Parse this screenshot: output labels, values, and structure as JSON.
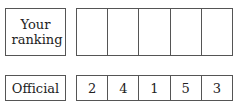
{
  "rows": [
    {
      "label": "Your ranking",
      "cells": [
        "",
        "",
        "",
        "",
        ""
      ]
    },
    {
      "label": "Official",
      "cells": [
        "2",
        "4",
        "1",
        "5",
        "3"
      ]
    }
  ]
}
